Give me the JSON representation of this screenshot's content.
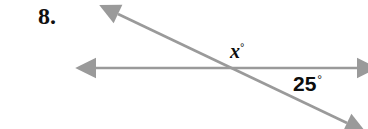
{
  "problem": {
    "number": "8."
  },
  "figure": {
    "type": "two-intersecting-lines",
    "background_color": "#ffffff",
    "line_color": "#9a9a9a",
    "line_width": 2.6,
    "intersection": {
      "x": 237,
      "y": 68
    },
    "lines": [
      {
        "name": "horizontal-line",
        "x1": 96,
        "y1": 68,
        "x2": 357,
        "y2": 68,
        "arrow_start": true,
        "arrow_end": true
      },
      {
        "name": "diagonal-line",
        "x1": 118,
        "y1": 14,
        "x2": 347,
        "y2": 123,
        "arrow_start": true,
        "arrow_end": true
      }
    ],
    "labels": [
      {
        "name": "angle-x",
        "value": "x",
        "degree_symbol": "°",
        "position": {
          "x": 230,
          "y": 41
        },
        "color": "#0d0d0d"
      },
      {
        "name": "angle-25",
        "value": "25",
        "degree_symbol": "°",
        "position": {
          "x": 293,
          "y": 73
        },
        "color": "#0d0d0d"
      }
    ]
  }
}
